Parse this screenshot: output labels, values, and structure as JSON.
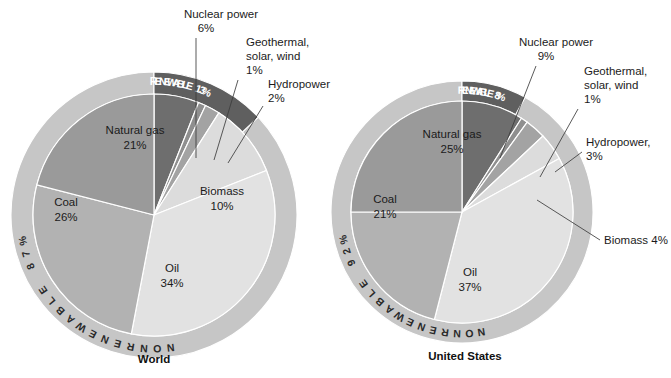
{
  "figure": {
    "background": "#ffffff",
    "palette": {
      "nuclear": "#6e6e6e",
      "geothermal": "#8f8f8f",
      "hydropower": "#a3a3a3",
      "biomass": "#dcdcdc",
      "oil": "#e2e2e2",
      "coal": "#b2b2b2",
      "natural_gas": "#9a9a9a",
      "renewable_arc": "#5f5f5f",
      "nonrenewable_arc": "#c6c6c6",
      "separator": "#ffffff",
      "leader_line": "#3c3c3c",
      "text_dark": "#1b1b1b",
      "text_light": "#ffffff"
    }
  },
  "chart_data": [
    {
      "type": "pie",
      "title": "World",
      "caption": "World",
      "center": [
        154,
        215
      ],
      "outer_ring_radius": 143,
      "pie_radius": 122,
      "categories": [
        "Nuclear power",
        "Geothermal, solar, wind",
        "Hydropower",
        "Biomass",
        "Oil",
        "Coal",
        "Natural gas"
      ],
      "values": [
        6,
        1,
        2,
        10,
        34,
        26,
        21
      ],
      "labels": [
        {
          "name": "Nuclear power",
          "value": 6,
          "text": "Nuclear power",
          "pct": "6%",
          "callout": true
        },
        {
          "name": "Geothermal, solar, wind",
          "value": 1,
          "text_line1": "Geothermal,",
          "text_line2": "solar, wind",
          "pct": "1%",
          "callout": true
        },
        {
          "name": "Hydropower",
          "value": 2,
          "text": "Hydropower",
          "pct": "2%",
          "callout": true
        },
        {
          "name": "Biomass",
          "value": 10,
          "text": "Biomass",
          "pct": "10%",
          "callout": false
        },
        {
          "name": "Oil",
          "value": 34,
          "text": "Oil",
          "pct": "34%",
          "callout": false
        },
        {
          "name": "Coal",
          "value": 26,
          "text": "Coal",
          "pct": "26%",
          "callout": false
        },
        {
          "name": "Natural gas",
          "value": 21,
          "text": "Natural gas",
          "pct": "21%",
          "callout": false
        }
      ],
      "rings": [
        {
          "name": "RENEWABLE",
          "label": "RENEWABLE 13%",
          "value": 13,
          "color": "#5f5f5f",
          "text_color": "#ffffff"
        },
        {
          "name": "NONRENEWABLE",
          "label": "NONRENEWABLE 87%",
          "value": 87,
          "color": "#c6c6c6",
          "text_color": "#2a2a2a"
        }
      ],
      "xlabel": "",
      "ylabel": "",
      "legend": "none",
      "grid": false
    },
    {
      "type": "pie",
      "title": "United States",
      "caption": "United States",
      "center": [
        462,
        212
      ],
      "outer_ring_radius": 131,
      "pie_radius": 112,
      "categories": [
        "Nuclear power",
        "Geothermal, solar, wind",
        "Hydropower",
        "Biomass",
        "Oil",
        "Coal",
        "Natural gas"
      ],
      "values": [
        9,
        1,
        3,
        4,
        37,
        21,
        25
      ],
      "labels": [
        {
          "name": "Nuclear power",
          "value": 9,
          "text": "Nuclear power",
          "pct": "9%",
          "callout": true
        },
        {
          "name": "Geothermal, solar, wind",
          "value": 1,
          "text_line1": "Geothermal,",
          "text_line2": "solar, wind",
          "pct": "1%",
          "callout": true
        },
        {
          "name": "Hydropower",
          "value": 3,
          "text": "Hydropower,",
          "pct": "3%",
          "callout": true
        },
        {
          "name": "Biomass",
          "value": 4,
          "text": "Biomass 4%",
          "pct": "4%",
          "callout": true
        },
        {
          "name": "Oil",
          "value": 37,
          "text": "Oil",
          "pct": "37%",
          "callout": false
        },
        {
          "name": "Coal",
          "value": 21,
          "text": "Coal",
          "pct": "21%",
          "callout": false
        },
        {
          "name": "Natural gas",
          "value": 25,
          "text": "Natural gas",
          "pct": "25%",
          "callout": false
        }
      ],
      "rings": [
        {
          "name": "RENEWABLE",
          "label": "RENEWABLE 8%",
          "value": 8,
          "color": "#5f5f5f",
          "text_color": "#ffffff"
        },
        {
          "name": "NONRENEWABLE",
          "label": "NONRENEWABLE 92%",
          "value": 92,
          "color": "#c6c6c6",
          "text_color": "#2a2a2a"
        }
      ],
      "xlabel": "",
      "ylabel": "",
      "legend": "none",
      "grid": false
    }
  ]
}
